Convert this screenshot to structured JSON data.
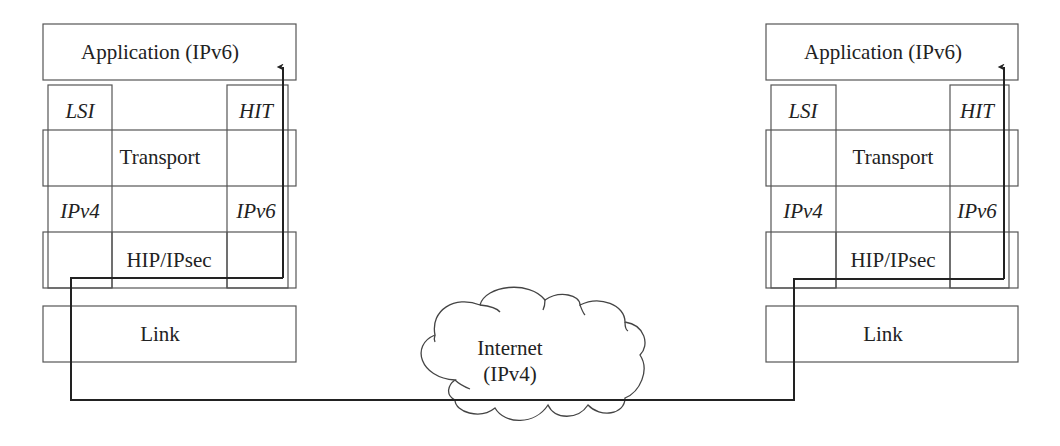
{
  "diagram": {
    "left_stack": {
      "application": "Application (IPv6)",
      "lsi": "LSI",
      "hit": "HIT",
      "transport": "Transport",
      "ipv4": "IPv4",
      "ipv6": "IPv6",
      "hip": "HIP/IPsec",
      "link": "Link"
    },
    "right_stack": {
      "application": "Application (IPv6)",
      "lsi": "LSI",
      "hit": "HIT",
      "transport": "Transport",
      "ipv4": "IPv4",
      "ipv6": "IPv6",
      "hip": "HIP/IPsec",
      "link": "Link"
    },
    "cloud": {
      "line1": "Internet",
      "line2": "(IPv4)"
    },
    "colors": {
      "stroke": "#555555",
      "path": "#222222",
      "background": "#ffffff"
    }
  }
}
